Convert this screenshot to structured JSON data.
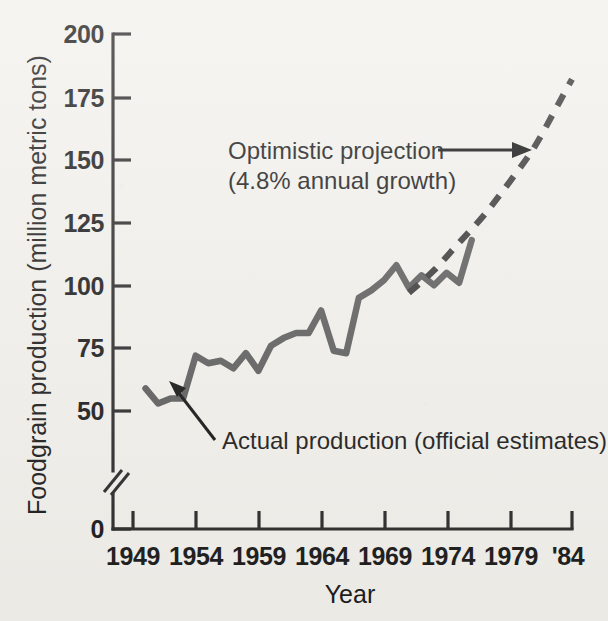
{
  "chart_data": {
    "type": "line",
    "title": "",
    "xlabel": "Year",
    "ylabel": "Foodgrain production (million metric tons)",
    "xlim": [
      1949,
      1984
    ],
    "ylim": [
      0,
      200
    ],
    "yticks": [
      0,
      50,
      75,
      100,
      125,
      150,
      175,
      200
    ],
    "ytick_labels": [
      "0",
      "50",
      "75",
      "100",
      "125",
      "150",
      "175",
      "200"
    ],
    "y_axis_break": true,
    "y_axis_break_note": "axis broken between 0 and 50",
    "xticks": [
      1949,
      1954,
      1959,
      1964,
      1969,
      1974,
      1979,
      1984
    ],
    "xtick_labels": [
      "1949",
      "1954",
      "1959",
      "1964",
      "1969",
      "1974",
      "1979",
      "'84"
    ],
    "grid": false,
    "legend": "none",
    "series": [
      {
        "name": "Actual production (official estimates)",
        "style": "solid",
        "color": "#5d5d5d",
        "x": [
          1950,
          1951,
          1952,
          1953,
          1954,
          1955,
          1956,
          1957,
          1958,
          1959,
          1960,
          1961,
          1962,
          1963,
          1964,
          1965,
          1966,
          1967,
          1968,
          1969,
          1970,
          1971,
          1972,
          1973,
          1974,
          1975,
          1976
        ],
        "values": [
          59,
          53,
          55,
          55,
          72,
          69,
          70,
          67,
          73,
          66,
          76,
          79,
          81,
          81,
          90,
          74,
          73,
          95,
          98,
          102,
          108,
          99,
          104,
          100,
          105,
          101,
          118
        ]
      },
      {
        "name": "Optimistic projection (4.8% annual growth)",
        "style": "dashed",
        "color": "#3a3a3a",
        "x": [
          1971,
          1973,
          1975,
          1977,
          1979,
          1981,
          1983,
          1984
        ],
        "values": [
          97,
          106,
          117,
          128,
          141,
          155,
          173,
          182
        ]
      }
    ],
    "annotations": [
      {
        "name": "optimistic-projection-label",
        "line1": "Optimistic projection",
        "line2": "(4.8% annual growth)",
        "arrow": "right"
      },
      {
        "name": "actual-production-label",
        "text": "Actual production (official estimates)",
        "arrow": "up-left"
      }
    ]
  },
  "axis": {
    "y_title": "Foodgrain production (million metric tons)",
    "x_title": "Year"
  },
  "colors": {
    "background": "#f3f1ec",
    "ink": "#1b1b1b",
    "actual_line": "#5d5d5d",
    "projection_line": "#3a3a3a"
  }
}
